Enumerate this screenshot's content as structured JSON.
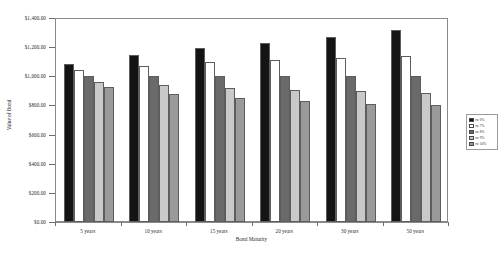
{
  "chart_data": {
    "type": "bar",
    "title": "",
    "xlabel": "Bond Maturity",
    "ylabel": "Value of Bond",
    "categories": [
      "5 years",
      "10 years",
      "15 years",
      "20 years",
      "30 years",
      "50 years"
    ],
    "ylim": [
      0,
      1400
    ],
    "ytick_values": [
      0,
      200,
      400,
      600,
      800,
      1000,
      1200,
      1400
    ],
    "ytick_labels": [
      "$0.00",
      "$200.00",
      "$400.00",
      "$600.00",
      "$800.00",
      "$1,000.00",
      "$1,200.00",
      "$1,400.00"
    ],
    "grid": false,
    "legend_position": "right",
    "series": [
      {
        "name": "rw 6%",
        "color": "#141414",
        "values": [
          1085,
          1148,
          1195,
          1228,
          1268,
          1320
        ]
      },
      {
        "name": "rw 7%",
        "color": "#ffffff",
        "values": [
          1042,
          1072,
          1100,
          1110,
          1128,
          1142
        ]
      },
      {
        "name": "rw 8%",
        "color": "#6a6a6a",
        "values": [
          1000,
          1000,
          1000,
          1000,
          1000,
          1000
        ]
      },
      {
        "name": "rw 9%",
        "color": "#c9c9c9",
        "values": [
          962,
          938,
          920,
          908,
          898,
          888
        ]
      },
      {
        "name": "rw 10%",
        "color": "#9a9a9a",
        "values": [
          925,
          878,
          848,
          830,
          812,
          805
        ]
      }
    ]
  },
  "legend": {
    "items": [
      {
        "label": "rw 6%",
        "color": "#141414"
      },
      {
        "label": "rw 7%",
        "color": "#ffffff"
      },
      {
        "label": "rw 8%",
        "color": "#6a6a6a"
      },
      {
        "label": "rw 9%",
        "color": "#c9c9c9"
      },
      {
        "label": "rw 10%",
        "color": "#9a9a9a"
      }
    ]
  },
  "axes": {
    "y_title": "Value of Bond",
    "x_title": "Bond Maturity"
  }
}
